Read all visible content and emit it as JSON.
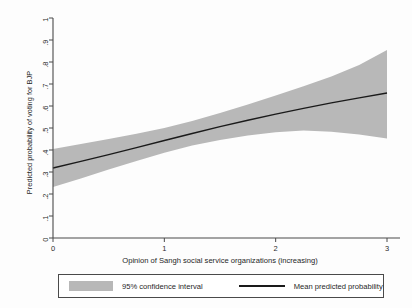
{
  "chart_data": {
    "type": "line",
    "title": "",
    "xlabel": "Opinion of Sangh social service organizations (increasing)",
    "ylabel": "Predicted probability of voting for BJP",
    "xlim": [
      0,
      3
    ],
    "ylim": [
      0,
      1
    ],
    "grid": false,
    "xticks": [
      0,
      1,
      2,
      3
    ],
    "xticklabels": [
      "0",
      "1",
      "2",
      "3"
    ],
    "yticks": [
      0,
      0.1,
      0.2,
      0.3,
      0.4,
      0.5,
      0.6,
      0.7,
      0.8,
      0.9,
      1
    ],
    "yticklabels": [
      "0",
      ".1",
      ".2",
      ".3",
      ".4",
      ".5",
      ".6",
      ".7",
      ".8",
      ".9",
      "1"
    ],
    "legend_position": "below-axes",
    "series": [
      {
        "name": "Mean predicted probability",
        "type": "line",
        "color": "#1a1a1a",
        "x": [
          0,
          0.25,
          0.5,
          0.75,
          1,
          1.25,
          1.5,
          1.75,
          2,
          2.25,
          2.5,
          2.75,
          3
        ],
        "values": [
          0.318,
          0.348,
          0.379,
          0.411,
          0.443,
          0.475,
          0.506,
          0.535,
          0.563,
          0.589,
          0.614,
          0.637,
          0.659
        ]
      },
      {
        "name": "95% confidence interval",
        "type": "band",
        "color": "#b8b8b8",
        "x": [
          0,
          0.25,
          0.5,
          0.75,
          1,
          1.25,
          1.5,
          1.75,
          2,
          2.25,
          2.5,
          2.75,
          3
        ],
        "lower": [
          0.232,
          0.271,
          0.311,
          0.35,
          0.388,
          0.42,
          0.446,
          0.466,
          0.481,
          0.489,
          0.483,
          0.47,
          0.452
        ],
        "upper": [
          0.405,
          0.427,
          0.45,
          0.474,
          0.5,
          0.532,
          0.568,
          0.607,
          0.648,
          0.69,
          0.734,
          0.786,
          0.855
        ]
      }
    ]
  },
  "axes": {
    "x_tick_labels": [
      "0",
      "1",
      "2",
      "3"
    ],
    "y_tick_labels": [
      "0",
      ".1",
      ".2",
      ".3",
      ".4",
      ".5",
      ".6",
      ".7",
      ".8",
      ".9",
      "1"
    ],
    "x_axis_title": "Opinion of Sangh social service organizations (increasing)",
    "y_axis_title": "Predicted probability of voting for BJP"
  },
  "legend": {
    "items": [
      {
        "label": "95% confidence interval",
        "marker": "swatch",
        "color": "#b8b8b8"
      },
      {
        "label": "Mean predicted probability",
        "marker": "line",
        "color": "#1a1a1a"
      }
    ]
  },
  "colors": {
    "band": "#b8b8b8",
    "line": "#1a1a1a",
    "axis": "#4a4a4a",
    "text": "#1f1f1f",
    "background": "#fdfdfd"
  }
}
